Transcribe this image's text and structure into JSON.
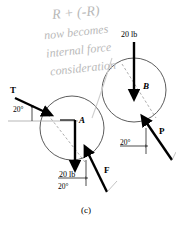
{
  "figure": {
    "caption": "(c)",
    "handwritten_annotation": {
      "line1": "R + (-R)",
      "line2": "now becomes",
      "line3": "internal force",
      "line4": "consideration",
      "color": "#b9b9b9"
    },
    "bodies": [
      {
        "id": "A",
        "label": "A",
        "center_x": 72,
        "center_y": 128,
        "radius": 32
      },
      {
        "id": "B",
        "label": "B",
        "center_x": 134,
        "center_y": 90,
        "radius": 32
      }
    ],
    "forces": [
      {
        "name": "T",
        "label": "T",
        "magnitude": "",
        "angle_label": "20°"
      },
      {
        "name": "weight-A",
        "label": "20 lb",
        "magnitude": "20 lb",
        "angle_label": ""
      },
      {
        "name": "F",
        "label": "F",
        "magnitude": "",
        "angle_label": "20°"
      },
      {
        "name": "weight-B",
        "label": "20 lb",
        "magnitude": "20 lb",
        "angle_label": ""
      },
      {
        "name": "P",
        "label": "P",
        "magnitude": "",
        "angle_label": "20°"
      }
    ],
    "labels": {
      "force_t": "T",
      "force_f": "F",
      "force_p": "P",
      "body_a": "A",
      "body_b": "B",
      "weight_a": "20 lb",
      "weight_b": "20 lb",
      "angle_t": "20°",
      "angle_f": "20°",
      "angle_p": "20°"
    },
    "colors": {
      "ink": "#000000",
      "outline": "#4a4a4a",
      "dashed": "#8a8a8a",
      "pencil": "#b9b9b9"
    }
  }
}
